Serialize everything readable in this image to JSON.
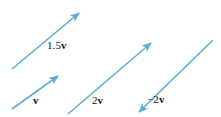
{
  "figure": {
    "name": "scalar-multiples-of-vector-v",
    "background_color": "#ffffff",
    "width": 221,
    "height": 117,
    "vector_color": "#5aaed6",
    "label_color": "#121212"
  },
  "vectors": [
    {
      "id": "vector-1-5v",
      "scalar_text": "1.5",
      "symbol_text": "v",
      "label_full": "1.5v",
      "scalar_value": 1.5,
      "direction": "up-right",
      "x1": 12,
      "y1": 69,
      "x2": 79,
      "y2": 13
    },
    {
      "id": "vector-v",
      "scalar_text": "",
      "symbol_text": "v",
      "label_full": "v",
      "scalar_value": 1,
      "direction": "up-right",
      "x1": 12,
      "y1": 109,
      "x2": 58,
      "y2": 76
    },
    {
      "id": "vector-2v",
      "scalar_text": "2",
      "symbol_text": "v",
      "label_full": "2v",
      "scalar_value": 2,
      "direction": "up-right",
      "x1": 68,
      "y1": 114,
      "x2": 151,
      "y2": 43
    },
    {
      "id": "vector-negative-2v",
      "scalar_text": "−2",
      "symbol_text": "v",
      "label_full": "−2v",
      "scalar_value": -2,
      "direction": "down-left",
      "x1": 213,
      "y1": 40,
      "x2": 139,
      "y2": 112
    }
  ]
}
